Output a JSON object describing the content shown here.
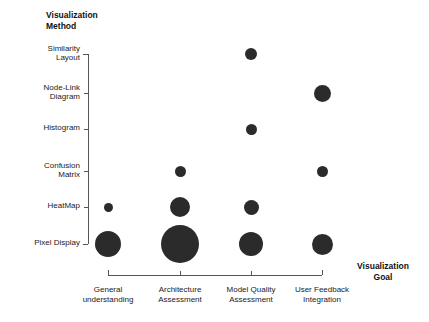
{
  "figure": {
    "background_color": "#ffffff",
    "bubble_color": "#2b2b2b",
    "axis_color": "#555555"
  },
  "y_axis": {
    "title": "Visualization\nMethod",
    "categories": [
      "Similarity\nLayout",
      "Node-Link\nDiagram",
      "Histogram",
      "Confusion\nMatrix",
      "HeatMap",
      "Pixel Display"
    ]
  },
  "x_axis": {
    "title": "Visualization\nGoal",
    "categories": [
      "General\nunderstanding",
      "Architecture\nAssessment",
      "Model Quality\nAssessment",
      "User Feedback\nIntegration"
    ]
  },
  "chart_data": {
    "type": "scatter",
    "title": "",
    "subtitle": "",
    "xlabel": "Visualization Goal",
    "ylabel": "Visualization Method",
    "grid": false,
    "legend": "none",
    "marker": "filled-circle",
    "marker_color": "#2b2b2b",
    "x_categories": [
      "General understanding",
      "Architecture Assessment",
      "Model Quality Assessment",
      "User Feedback Integration"
    ],
    "y_categories": [
      "Similarity Layout",
      "Node-Link Diagram",
      "Histogram",
      "Confusion Matrix",
      "HeatMap",
      "Pixel Display"
    ],
    "points": [
      {
        "x": "Model Quality Assessment",
        "y": "Similarity Layout",
        "radius": 6.0,
        "size": 2,
        "px": 251,
        "py": 54
      },
      {
        "x": "User Feedback Integration",
        "y": "Node-Link Diagram",
        "radius": 8.5,
        "size": 4,
        "px": 322,
        "py": 93
      },
      {
        "x": "Model Quality Assessment",
        "y": "Histogram",
        "radius": 5.5,
        "size": 2,
        "px": 251,
        "py": 129
      },
      {
        "x": "Architecture Assessment",
        "y": "Confusion Matrix",
        "radius": 5.5,
        "size": 2,
        "px": 180,
        "py": 171
      },
      {
        "x": "User Feedback Integration",
        "y": "Confusion Matrix",
        "radius": 5.5,
        "size": 2,
        "px": 322,
        "py": 171
      },
      {
        "x": "General understanding",
        "y": "HeatMap",
        "radius": 4.5,
        "size": 1,
        "px": 108,
        "py": 207
      },
      {
        "x": "Architecture Assessment",
        "y": "HeatMap",
        "radius": 10.0,
        "size": 5,
        "px": 180,
        "py": 207
      },
      {
        "x": "Model Quality Assessment",
        "y": "HeatMap",
        "radius": 7.5,
        "size": 3,
        "px": 251,
        "py": 207
      },
      {
        "x": "General understanding",
        "y": "Pixel Display",
        "radius": 13.0,
        "size": 8,
        "px": 108,
        "py": 244
      },
      {
        "x": "Architecture Assessment",
        "y": "Pixel Display",
        "radius": 19.0,
        "size": 16,
        "px": 180,
        "py": 244
      },
      {
        "x": "Model Quality Assessment",
        "y": "Pixel Display",
        "radius": 12.0,
        "size": 7,
        "px": 251,
        "py": 244
      },
      {
        "x": "User Feedback Integration",
        "y": "Pixel Display",
        "radius": 10.5,
        "size": 5,
        "px": 322,
        "py": 244
      }
    ]
  },
  "geometry": {
    "y_positions": [
      54,
      93,
      129,
      171,
      207,
      244
    ],
    "x_positions": [
      108,
      180,
      251,
      322
    ],
    "y_axis_line_x": 88,
    "x_axis_line_y": 275
  }
}
